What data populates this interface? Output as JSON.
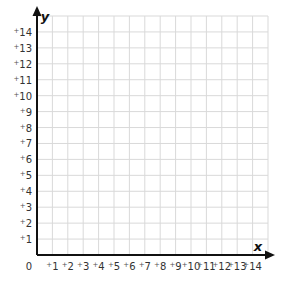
{
  "chart_data": {
    "type": "coordinate-grid",
    "title": "",
    "xlabel": "x",
    "ylabel": "y",
    "origin_label": "0",
    "xlim": [
      0,
      15
    ],
    "ylim": [
      0,
      15
    ],
    "grid": true,
    "x_ticks": [
      "+1",
      "+2",
      "+3",
      "+4",
      "+5",
      "+6",
      "+7",
      "+8",
      "+9",
      "+10",
      "+11",
      "+12",
      "+13",
      "+14"
    ],
    "y_ticks": [
      "+1",
      "+2",
      "+3",
      "+4",
      "+5",
      "+6",
      "+7",
      "+8",
      "+9",
      "+10",
      "+11",
      "+12",
      "+13",
      "+14"
    ],
    "points": []
  },
  "colors": {
    "grid": "#d9d9d9",
    "axis": "#111111",
    "text": "#333333"
  }
}
